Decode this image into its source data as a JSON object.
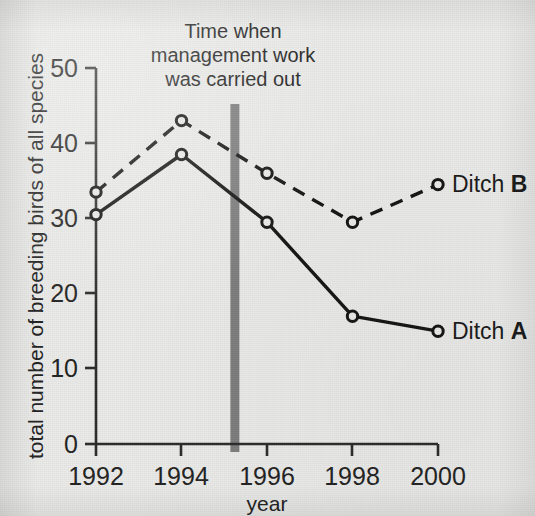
{
  "figure": {
    "background_color": "#e9e9e7",
    "ink_color": "#1f1f1f",
    "marker_color": "#141414",
    "event_bar_color": "#7d7d7d"
  },
  "annotation": {
    "line1": "Time when",
    "line2": "management work",
    "line3": "was carried out",
    "at_x": 1995.25
  },
  "series_labels": {
    "ditch_b_name": "Ditch ",
    "ditch_b_key": "B",
    "ditch_a_name": "Ditch ",
    "ditch_a_key": "A"
  },
  "axes": {
    "y_ticks": [
      "0",
      "10",
      "20",
      "30",
      "40",
      "50"
    ],
    "x_ticks": [
      "1992",
      "1994",
      "1996",
      "1998",
      "2000"
    ]
  },
  "chart_data": {
    "type": "line",
    "title": "",
    "xlabel": "year",
    "ylabel": "total number of breeding birds of all species",
    "x": [
      1992,
      1994,
      1996,
      1998,
      2000
    ],
    "xlim": [
      1991.4,
      2000.6
    ],
    "ylim": [
      0,
      50
    ],
    "y_ticks": [
      0,
      10,
      20,
      30,
      40,
      50
    ],
    "x_ticks": [
      1992,
      1994,
      1996,
      1998,
      2000
    ],
    "grid": false,
    "legend": "inline labels at right end of each line",
    "annotations": [
      {
        "text": "Time when management work was carried out",
        "type": "vertical-bar",
        "x": 1995.25,
        "color": "#7d7d7d"
      }
    ],
    "series": [
      {
        "name": "Ditch B",
        "linestyle": "dashed",
        "marker": "circle-open",
        "values": [
          33.5,
          43.0,
          36.0,
          29.5,
          34.5
        ]
      },
      {
        "name": "Ditch A",
        "linestyle": "solid",
        "marker": "circle-open",
        "values": [
          30.5,
          38.5,
          29.5,
          17.0,
          15.0
        ]
      }
    ]
  }
}
